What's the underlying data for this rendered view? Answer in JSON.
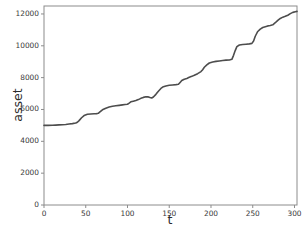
{
  "chart_data": {
    "type": "line",
    "title": "",
    "subtitle": "",
    "xlabel": "t",
    "ylabel": "asset",
    "xlim": [
      0,
      303
    ],
    "ylim": [
      0,
      12500
    ],
    "xticks": [
      0,
      50,
      100,
      150,
      200,
      250,
      300
    ],
    "xtick_labels": [
      "0",
      "50",
      "100",
      "150",
      "200",
      "250",
      "300"
    ],
    "yticks": [
      0,
      2000,
      4000,
      6000,
      8000,
      10000,
      12000
    ],
    "ytick_labels": [
      "0",
      "2000",
      "4000",
      "6000",
      "8000",
      "10000",
      "12000"
    ],
    "grid": false,
    "legend": null,
    "legend_position": "none",
    "line_color": "#4d4d4d",
    "line_width": 1.6,
    "background_color": "#ffffff",
    "axes_color": "#8c8c8c",
    "annotations": [],
    "series": [
      {
        "name": "asset",
        "x": [
          0,
          5,
          10,
          14,
          18,
          22,
          26,
          30,
          34,
          38,
          40,
          42,
          45,
          48,
          52,
          56,
          60,
          63,
          65,
          67,
          70,
          74,
          78,
          82,
          86,
          90,
          94,
          97,
          100,
          102,
          104,
          107,
          110,
          113,
          116,
          119,
          122,
          125,
          127,
          129,
          131,
          134,
          137,
          140,
          143,
          146,
          150,
          154,
          158,
          161,
          163,
          165,
          168,
          171,
          174,
          177,
          180,
          184,
          188,
          190,
          192,
          195,
          198,
          202,
          206,
          210,
          214,
          218,
          222,
          225,
          227,
          229,
          231,
          234,
          238,
          242,
          246,
          249,
          251,
          253,
          256,
          259,
          262,
          265,
          268,
          271,
          274,
          277,
          280,
          283,
          286,
          289,
          292,
          295,
          298,
          301,
          303
        ],
        "y": [
          5000,
          5000,
          5010,
          5020,
          5030,
          5040,
          5060,
          5090,
          5110,
          5150,
          5200,
          5300,
          5480,
          5620,
          5700,
          5720,
          5730,
          5740,
          5760,
          5850,
          5980,
          6080,
          6150,
          6200,
          6230,
          6260,
          6290,
          6310,
          6330,
          6400,
          6480,
          6520,
          6560,
          6620,
          6700,
          6760,
          6800,
          6790,
          6750,
          6720,
          6780,
          6950,
          7150,
          7320,
          7430,
          7480,
          7520,
          7540,
          7560,
          7580,
          7700,
          7820,
          7900,
          7950,
          8020,
          8080,
          8150,
          8250,
          8380,
          8500,
          8650,
          8800,
          8920,
          8980,
          9020,
          9050,
          9080,
          9100,
          9110,
          9150,
          9400,
          9700,
          9950,
          10050,
          10080,
          10100,
          10120,
          10150,
          10300,
          10600,
          10900,
          11050,
          11150,
          11200,
          11250,
          11280,
          11320,
          11450,
          11600,
          11720,
          11800,
          11850,
          11920,
          12020,
          12100,
          12140,
          12160
        ]
      }
    ]
  }
}
